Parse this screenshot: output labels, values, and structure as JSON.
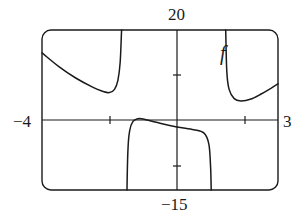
{
  "chart_data": {
    "type": "line",
    "title": "",
    "xlabel": "",
    "ylabel": "",
    "xlim": [
      -4,
      3
    ],
    "ylim": [
      -15,
      20
    ],
    "grid": false,
    "legend": null,
    "axis_labels": {
      "x_min": "−4",
      "x_max": "3",
      "y_max": "20",
      "y_min": "−15"
    },
    "x_ticks": [
      -2,
      2
    ],
    "y_ticks": [
      -10,
      10
    ],
    "annotations": [
      {
        "text": "f",
        "x": 1.75,
        "y": 15.5
      }
    ],
    "series": [
      {
        "name": "f (left branch)",
        "points": [
          [
            -4,
            15
          ],
          [
            -3.5,
            12
          ],
          [
            -3,
            9.5
          ],
          [
            -2.5,
            7.5
          ],
          [
            -2.2,
            6.6
          ],
          [
            -2.0,
            6.3
          ],
          [
            -1.85,
            7
          ],
          [
            -1.75,
            9
          ],
          [
            -1.68,
            13
          ],
          [
            -1.64,
            20
          ]
        ]
      },
      {
        "name": "f (middle branch)",
        "points": [
          [
            -1.48,
            -15
          ],
          [
            -1.45,
            -6
          ],
          [
            -1.4,
            -2
          ],
          [
            -1.3,
            0
          ],
          [
            -1.15,
            0.6
          ],
          [
            -1.0,
            0.5
          ],
          [
            -0.5,
            -0.4
          ],
          [
            0,
            -1.2
          ],
          [
            0.5,
            -1.8
          ],
          [
            0.8,
            -2.5
          ],
          [
            0.95,
            -5
          ],
          [
            1.0,
            -10
          ],
          [
            1.02,
            -15
          ]
        ]
      },
      {
        "name": "f (right branch)",
        "points": [
          [
            1.45,
            20
          ],
          [
            1.48,
            11
          ],
          [
            1.55,
            7
          ],
          [
            1.7,
            5
          ],
          [
            1.9,
            4.5
          ],
          [
            2.2,
            4.9
          ],
          [
            2.5,
            6
          ],
          [
            2.8,
            7.3
          ],
          [
            3,
            8.2
          ]
        ]
      }
    ]
  },
  "labels": {
    "y_max": "20",
    "y_min": "−15",
    "x_min": "−4",
    "x_max": "3",
    "function_name": "f"
  },
  "colors": {
    "curve": "#1a1a1a",
    "frame": "#1a1a1a",
    "background": "#ffffff"
  }
}
